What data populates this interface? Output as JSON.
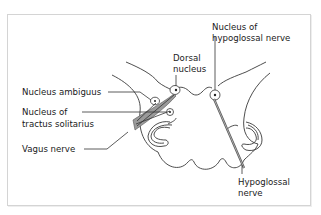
{
  "figure": {
    "type": "anatomical cross-section of medulla oblongata",
    "labels": {
      "nucleus_ambiguus": "Nucleus ambiguus",
      "nucleus_tractus_line1": "Nucleus of",
      "nucleus_tractus_line2": "tractus solitarius",
      "vagus_nerve": "Vagus nerve",
      "dorsal_line1": "Dorsal",
      "dorsal_line2": "nucleus",
      "hypoglossal_nucleus_line1": "Nucleus of",
      "hypoglossal_nucleus_line2": "hypoglossal nerve",
      "hypoglossal_nerve_line1": "Hypoglossal",
      "hypoglossal_nerve_line2": "nerve"
    },
    "colors": {
      "outline": "#3a3a3a",
      "nerve_fill": "#9a9a9a",
      "border": "#d4d4d4",
      "text": "#1a1a1a"
    }
  }
}
